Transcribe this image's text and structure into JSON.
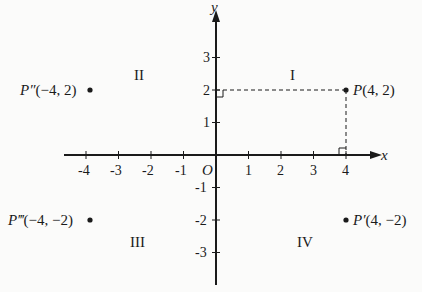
{
  "diagram": {
    "axes": {
      "x_label": "x",
      "y_label": "y",
      "origin_label": "O",
      "x_ticks": [
        "-4",
        "-3",
        "-2",
        "-1",
        "1",
        "2",
        "3",
        "4"
      ],
      "y_ticks": [
        "3",
        "2",
        "1",
        "-1",
        "-2",
        "-3"
      ]
    },
    "quadrants": {
      "q1": "I",
      "q2": "II",
      "q3": "III",
      "q4": "IV"
    },
    "points": [
      {
        "id": "P",
        "label": "P(4, 2)",
        "x": 4,
        "y": 2
      },
      {
        "id": "P-double-prime",
        "label": "P″(−4, 2)",
        "x": -4,
        "y": 2
      },
      {
        "id": "P-triple-prime",
        "label": "P‴(−4, −2)",
        "x": -4,
        "y": -2
      },
      {
        "id": "P-prime",
        "label": "P′(4, −2)",
        "x": 4,
        "y": -2
      }
    ],
    "colors": {
      "ink": "#1a1a1a",
      "background": "#fbfbfa"
    }
  }
}
